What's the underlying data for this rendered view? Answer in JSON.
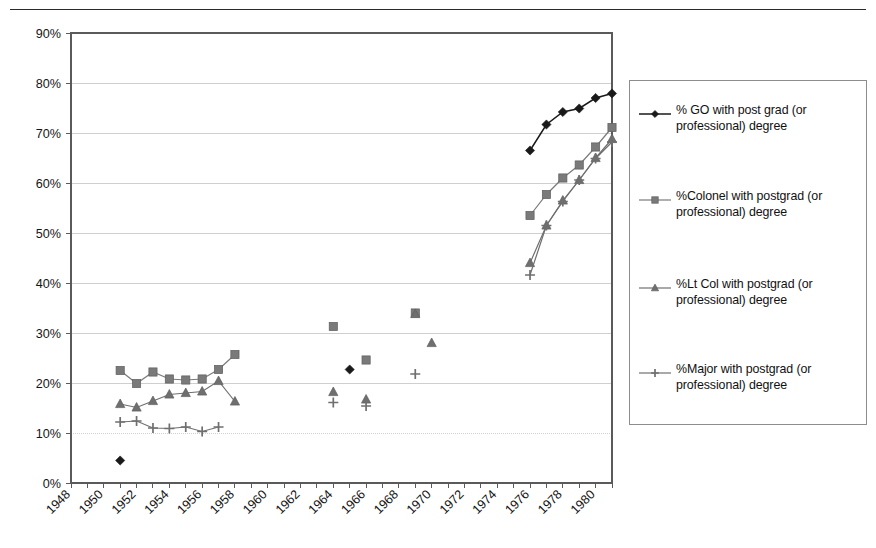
{
  "chart_data": {
    "type": "line",
    "title": "",
    "xlabel": "",
    "ylabel": "",
    "xlim": [
      1948,
      1981
    ],
    "ylim": [
      0,
      0.9
    ],
    "y_tick_labels": [
      "0%",
      "10%",
      "20%",
      "30%",
      "40%",
      "50%",
      "60%",
      "70%",
      "80%",
      "90%"
    ],
    "y_tick_values": [
      0,
      10,
      20,
      30,
      40,
      50,
      60,
      70,
      80,
      90
    ],
    "x_tick_labels": [
      "1948",
      "1950",
      "1952",
      "1954",
      "1956",
      "1958",
      "1960",
      "1962",
      "1964",
      "1966",
      "1968",
      "1970",
      "1972",
      "1974",
      "1976",
      "1978",
      "1980"
    ],
    "x_tick_values": [
      1948,
      1950,
      1952,
      1954,
      1956,
      1958,
      1960,
      1962,
      1964,
      1966,
      1968,
      1970,
      1972,
      1974,
      1976,
      1978,
      1980
    ],
    "x_minor_step": 1,
    "grid": "horizontal",
    "legend_position": "right",
    "series": [
      {
        "name": "% GO with post grad (or professional) degree",
        "marker": "diamond",
        "color": "#1a1a1a",
        "segments": [
          [
            {
              "x": 1951,
              "y": 4.5
            }
          ],
          [
            {
              "x": 1965,
              "y": 22.7
            }
          ],
          [
            {
              "x": 1976,
              "y": 66.5
            },
            {
              "x": 1977,
              "y": 71.7
            },
            {
              "x": 1978,
              "y": 74.2
            },
            {
              "x": 1979,
              "y": 74.9
            },
            {
              "x": 1980,
              "y": 77.0
            },
            {
              "x": 1981,
              "y": 77.9
            }
          ]
        ]
      },
      {
        "name": "%Colonel with postgrad (or professional) degree",
        "marker": "square",
        "color": "#7a7a7a",
        "segments": [
          [
            {
              "x": 1951,
              "y": 22.5
            },
            {
              "x": 1952,
              "y": 19.9
            },
            {
              "x": 1953,
              "y": 22.2
            },
            {
              "x": 1954,
              "y": 20.8
            },
            {
              "x": 1955,
              "y": 20.6
            },
            {
              "x": 1956,
              "y": 20.8
            },
            {
              "x": 1957,
              "y": 22.7
            },
            {
              "x": 1958,
              "y": 25.7
            }
          ],
          [
            {
              "x": 1964,
              "y": 31.3
            }
          ],
          [
            {
              "x": 1966,
              "y": 24.6
            }
          ],
          [
            {
              "x": 1969,
              "y": 34.0
            }
          ],
          [
            {
              "x": 1976,
              "y": 53.5
            },
            {
              "x": 1977,
              "y": 57.7
            },
            {
              "x": 1978,
              "y": 61.0
            },
            {
              "x": 1979,
              "y": 63.6
            },
            {
              "x": 1980,
              "y": 67.2
            },
            {
              "x": 1981,
              "y": 71.1
            }
          ]
        ]
      },
      {
        "name": "%Lt Col with postgrad (or professional) degree",
        "marker": "triangle",
        "color": "#6f6f6f",
        "segments": [
          [
            {
              "x": 1951,
              "y": 15.8
            },
            {
              "x": 1952,
              "y": 15.1
            },
            {
              "x": 1953,
              "y": 16.4
            },
            {
              "x": 1954,
              "y": 17.7
            },
            {
              "x": 1955,
              "y": 18.0
            },
            {
              "x": 1956,
              "y": 18.3
            },
            {
              "x": 1957,
              "y": 20.4
            },
            {
              "x": 1958,
              "y": 16.3
            }
          ],
          [
            {
              "x": 1964,
              "y": 18.2
            }
          ],
          [
            {
              "x": 1966,
              "y": 16.7
            }
          ],
          [
            {
              "x": 1969,
              "y": 33.8
            }
          ],
          [
            {
              "x": 1970,
              "y": 28.0
            }
          ],
          [
            {
              "x": 1976,
              "y": 44.0
            },
            {
              "x": 1977,
              "y": 51.5
            },
            {
              "x": 1978,
              "y": 56.5
            },
            {
              "x": 1979,
              "y": 60.6
            },
            {
              "x": 1980,
              "y": 65.0
            },
            {
              "x": 1981,
              "y": 68.8
            }
          ]
        ]
      },
      {
        "name": "%Major with postgrad (or professional) degree",
        "marker": "plus",
        "color": "#6f6f6f",
        "segments": [
          [
            {
              "x": 1951,
              "y": 12.2
            },
            {
              "x": 1952,
              "y": 12.4
            },
            {
              "x": 1953,
              "y": 11.0
            },
            {
              "x": 1954,
              "y": 10.9
            },
            {
              "x": 1955,
              "y": 11.2
            },
            {
              "x": 1956,
              "y": 10.3
            },
            {
              "x": 1957,
              "y": 11.2
            }
          ],
          [
            {
              "x": 1964,
              "y": 16.1
            }
          ],
          [
            {
              "x": 1966,
              "y": 15.4
            }
          ],
          [
            {
              "x": 1969,
              "y": 21.8
            }
          ],
          [
            {
              "x": 1976,
              "y": 41.6
            },
            {
              "x": 1977,
              "y": 51.5
            },
            {
              "x": 1978,
              "y": 56.3
            },
            {
              "x": 1979,
              "y": 60.6
            },
            {
              "x": 1980,
              "y": 64.9
            },
            {
              "x": 1981,
              "y": 68.2
            }
          ]
        ]
      }
    ]
  },
  "legend": {
    "items": [
      {
        "label": "% GO with post grad (or professional) degree",
        "marker": "diamond",
        "color": "#1a1a1a"
      },
      {
        "label": "%Colonel with postgrad (or professional) degree",
        "marker": "square",
        "color": "#7a7a7a"
      },
      {
        "label": "%Lt Col with postgrad (or professional) degree",
        "marker": "triangle",
        "color": "#6f6f6f"
      },
      {
        "label": "%Major with postgrad (or professional) degree",
        "marker": "plus",
        "color": "#6f6f6f"
      }
    ]
  },
  "colors": {
    "axis": "#5a5a5a",
    "grid": "#cfcfcf",
    "text": "#151515",
    "rule": "#2b2b2b"
  }
}
